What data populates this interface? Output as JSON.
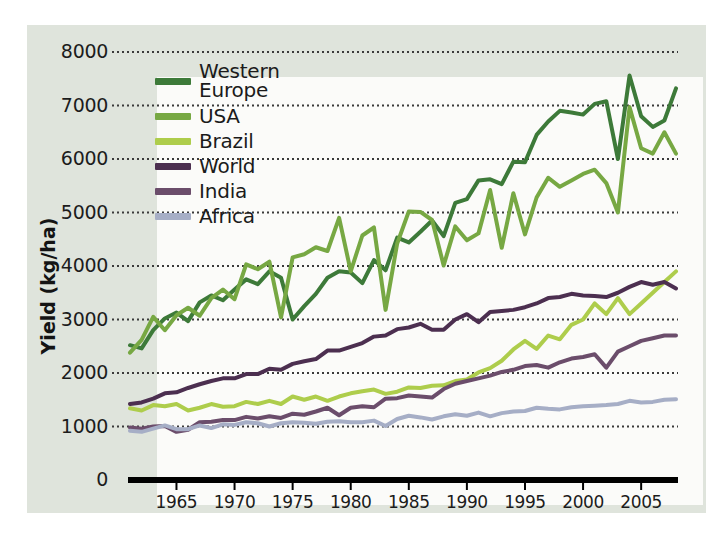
{
  "chart_data": {
    "type": "line",
    "title": "",
    "xlabel": "",
    "ylabel": "Yield (kg/ha)",
    "xlim": [
      1961,
      2008
    ],
    "ylim": [
      0,
      8000
    ],
    "grid": "horizontal-dotted",
    "legend_position": "upper-left-inside",
    "y_ticks": [
      0,
      1000,
      2000,
      3000,
      4000,
      5000,
      6000,
      7000,
      8000
    ],
    "y_tick_labels": [
      "0",
      "1000",
      "2000",
      "3000",
      "4000",
      "5000",
      "6000",
      "7000",
      "8000"
    ],
    "x_ticks": [
      1965,
      1970,
      1975,
      1980,
      1985,
      1990,
      1995,
      2000,
      2005
    ],
    "x_tick_labels": [
      "1965",
      "1970",
      "1975",
      "1980",
      "1985",
      "1990",
      "1995",
      "2000",
      "2005"
    ],
    "x": [
      1961,
      1962,
      1963,
      1964,
      1965,
      1966,
      1967,
      1968,
      1969,
      1970,
      1971,
      1972,
      1973,
      1974,
      1975,
      1976,
      1977,
      1978,
      1979,
      1980,
      1981,
      1982,
      1983,
      1984,
      1985,
      1986,
      1987,
      1988,
      1989,
      1990,
      1991,
      1992,
      1993,
      1994,
      1995,
      1996,
      1997,
      1998,
      1999,
      2000,
      2001,
      2002,
      2003,
      2004,
      2005,
      2006,
      2007,
      2008
    ],
    "series": [
      {
        "name": "Western Europe",
        "color": "#3d7a39",
        "values": [
          2520,
          2460,
          2800,
          3020,
          3130,
          2970,
          3320,
          3450,
          3360,
          3560,
          3750,
          3660,
          3900,
          3780,
          3000,
          3250,
          3480,
          3780,
          3900,
          3880,
          3680,
          4110,
          3920,
          4530,
          4440,
          4640,
          4850,
          4560,
          5180,
          5250,
          5600,
          5620,
          5530,
          5950,
          5940,
          6450,
          6700,
          6900,
          6870,
          6830,
          7030,
          7080,
          6000,
          7560,
          6800,
          6600,
          6720,
          7320
        ]
      },
      {
        "name": "USA",
        "color": "#77a843",
        "values": [
          2380,
          2620,
          3050,
          2800,
          3080,
          3220,
          3070,
          3400,
          3560,
          3380,
          4030,
          3940,
          4080,
          3040,
          4160,
          4220,
          4350,
          4280,
          4900,
          3900,
          4570,
          4720,
          3180,
          4420,
          5020,
          5010,
          4860,
          4010,
          4740,
          4480,
          4610,
          5420,
          4340,
          5360,
          4590,
          5280,
          5650,
          5480,
          5600,
          5720,
          5800,
          5550,
          5000,
          6970,
          6200,
          6100,
          6500,
          6100
        ]
      },
      {
        "name": "Brazil",
        "color": "#aecd4c",
        "values": [
          1340,
          1300,
          1400,
          1380,
          1420,
          1300,
          1350,
          1420,
          1370,
          1380,
          1460,
          1420,
          1480,
          1420,
          1560,
          1500,
          1560,
          1480,
          1560,
          1620,
          1660,
          1690,
          1610,
          1650,
          1730,
          1720,
          1760,
          1770,
          1850,
          1880,
          2010,
          2090,
          2230,
          2440,
          2600,
          2450,
          2700,
          2630,
          2900,
          3000,
          3300,
          3100,
          3400,
          3100,
          3300,
          3500,
          3700,
          3900
        ]
      },
      {
        "name": "World",
        "color": "#4c2f50",
        "values": [
          1420,
          1450,
          1520,
          1620,
          1640,
          1720,
          1790,
          1850,
          1900,
          1900,
          1980,
          1980,
          2080,
          2060,
          2170,
          2220,
          2260,
          2420,
          2420,
          2490,
          2560,
          2680,
          2700,
          2820,
          2850,
          2920,
          2810,
          2810,
          3000,
          3100,
          2950,
          3140,
          3160,
          3180,
          3230,
          3300,
          3400,
          3420,
          3480,
          3450,
          3440,
          3420,
          3500,
          3610,
          3700,
          3650,
          3700,
          3580
        ]
      },
      {
        "name": "India",
        "color": "#6b4d6b",
        "values": [
          980,
          960,
          1000,
          1010,
          900,
          940,
          1080,
          1090,
          1120,
          1120,
          1180,
          1150,
          1190,
          1160,
          1240,
          1220,
          1280,
          1350,
          1210,
          1350,
          1380,
          1360,
          1520,
          1530,
          1580,
          1560,
          1540,
          1700,
          1800,
          1850,
          1900,
          1950,
          2020,
          2060,
          2130,
          2150,
          2100,
          2200,
          2270,
          2300,
          2350,
          2100,
          2400,
          2500,
          2600,
          2650,
          2700,
          2700
        ]
      },
      {
        "name": "Africa",
        "color": "#a6aec6",
        "values": [
          920,
          900,
          960,
          1020,
          950,
          950,
          1020,
          970,
          1040,
          1030,
          1080,
          1060,
          1000,
          1060,
          1080,
          1070,
          1050,
          1090,
          1100,
          1080,
          1080,
          1110,
          1010,
          1140,
          1200,
          1170,
          1130,
          1190,
          1230,
          1200,
          1260,
          1190,
          1250,
          1280,
          1290,
          1350,
          1330,
          1320,
          1360,
          1380,
          1390,
          1400,
          1420,
          1480,
          1450,
          1460,
          1500,
          1510
        ]
      }
    ]
  },
  "axes": {
    "y_label": "Yield (kg/ha)",
    "y_ticks": [
      "8000",
      "7000",
      "6000",
      "5000",
      "4000",
      "3000",
      "2000",
      "1000",
      "0"
    ],
    "x_ticks": [
      "1965",
      "1970",
      "1975",
      "1980",
      "1985",
      "1990",
      "1995",
      "2000",
      "2005"
    ]
  },
  "legend": {
    "items": [
      {
        "label": "Western\nEurope",
        "color": "#3d7a39",
        "name": "western-europe"
      },
      {
        "label": "USA",
        "color": "#77a843",
        "name": "usa"
      },
      {
        "label": "Brazil",
        "color": "#aecd4c",
        "name": "brazil"
      },
      {
        "label": "World",
        "color": "#4c2f50",
        "name": "world"
      },
      {
        "label": "India",
        "color": "#6b4d6b",
        "name": "india"
      },
      {
        "label": "Africa",
        "color": "#a6aec6",
        "name": "africa"
      }
    ]
  },
  "colors": {
    "page_background": "#ffffff",
    "panel_background": "#dfe4dc",
    "plot_background": "#fbfbf9",
    "axis": "#000000",
    "gridline": "#3a3a3a",
    "text": "#1c1c1c"
  }
}
